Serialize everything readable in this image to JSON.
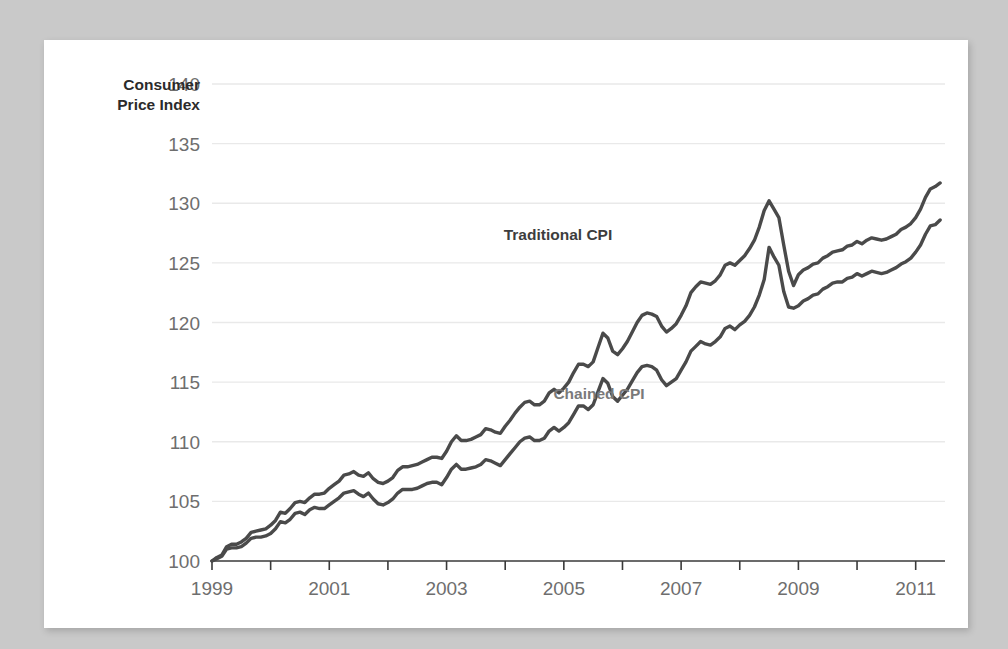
{
  "figure": {
    "background_color": "#c9c9c9",
    "card_color": "#ffffff"
  },
  "chart_data": {
    "type": "line",
    "title": "",
    "subtitle": "",
    "ylabel": "Consumer Price Index",
    "xlabel": "",
    "ylim": [
      100,
      140
    ],
    "xlim": [
      1999.0,
      2011.5
    ],
    "yticks": [
      100,
      105,
      110,
      115,
      120,
      125,
      130,
      135,
      140
    ],
    "ytick_labels": [
      "100",
      "105",
      "110",
      "115",
      "120",
      "125",
      "130",
      "135",
      "140"
    ],
    "xticks": [
      1999,
      2000,
      2001,
      2002,
      2003,
      2004,
      2005,
      2006,
      2007,
      2008,
      2009,
      2010,
      2011
    ],
    "xtick_labels": [
      "1999",
      "",
      "2001",
      "",
      "2003",
      "",
      "2005",
      "",
      "2007",
      "",
      "2009",
      "",
      "2011"
    ],
    "grid": "horizontal",
    "legend_position": "inline-annotations",
    "line_color": "#4a4a4a",
    "annotations": [
      {
        "text": "Traditional CPI",
        "x": 2004.9,
        "y": 126.9,
        "color": "#3d3d3d"
      },
      {
        "text": "Chained CPI",
        "x": 2005.6,
        "y": 113.6,
        "color": "#7a7a7a"
      }
    ],
    "series": [
      {
        "name": "Traditional CPI",
        "color": "#4a4a4a",
        "x": [
          1999.0,
          1999.083,
          1999.167,
          1999.25,
          1999.333,
          1999.417,
          1999.5,
          1999.583,
          1999.667,
          1999.75,
          1999.833,
          1999.917,
          2000.0,
          2000.083,
          2000.167,
          2000.25,
          2000.333,
          2000.417,
          2000.5,
          2000.583,
          2000.667,
          2000.75,
          2000.833,
          2000.917,
          2001.0,
          2001.083,
          2001.167,
          2001.25,
          2001.333,
          2001.417,
          2001.5,
          2001.583,
          2001.667,
          2001.75,
          2001.833,
          2001.917,
          2002.0,
          2002.083,
          2002.167,
          2002.25,
          2002.333,
          2002.417,
          2002.5,
          2002.583,
          2002.667,
          2002.75,
          2002.833,
          2002.917,
          2003.0,
          2003.083,
          2003.167,
          2003.25,
          2003.333,
          2003.417,
          2003.5,
          2003.583,
          2003.667,
          2003.75,
          2003.833,
          2003.917,
          2004.0,
          2004.083,
          2004.167,
          2004.25,
          2004.333,
          2004.417,
          2004.5,
          2004.583,
          2004.667,
          2004.75,
          2004.833,
          2004.917,
          2005.0,
          2005.083,
          2005.167,
          2005.25,
          2005.333,
          2005.417,
          2005.5,
          2005.583,
          2005.667,
          2005.75,
          2005.833,
          2005.917,
          2006.0,
          2006.083,
          2006.167,
          2006.25,
          2006.333,
          2006.417,
          2006.5,
          2006.583,
          2006.667,
          2006.75,
          2006.833,
          2006.917,
          2007.0,
          2007.083,
          2007.167,
          2007.25,
          2007.333,
          2007.417,
          2007.5,
          2007.583,
          2007.667,
          2007.75,
          2007.833,
          2007.917,
          2008.0,
          2008.083,
          2008.167,
          2008.25,
          2008.333,
          2008.417,
          2008.5,
          2008.583,
          2008.667,
          2008.75,
          2008.833,
          2008.917,
          2009.0,
          2009.083,
          2009.167,
          2009.25,
          2009.333,
          2009.417,
          2009.5,
          2009.583,
          2009.667,
          2009.75,
          2009.833,
          2009.917,
          2010.0,
          2010.083,
          2010.167,
          2010.25,
          2010.333,
          2010.417,
          2010.5,
          2010.583,
          2010.667,
          2010.75,
          2010.833,
          2010.917,
          2011.0,
          2011.083,
          2011.167,
          2011.25,
          2011.333,
          2011.417
        ],
        "y": [
          100.0,
          100.3,
          100.5,
          101.2,
          101.4,
          101.4,
          101.6,
          101.9,
          102.4,
          102.5,
          102.6,
          102.7,
          103.0,
          103.4,
          104.1,
          104.0,
          104.4,
          104.9,
          105.0,
          104.9,
          105.3,
          105.6,
          105.6,
          105.7,
          106.1,
          106.4,
          106.7,
          107.2,
          107.3,
          107.5,
          107.2,
          107.1,
          107.4,
          106.9,
          106.6,
          106.5,
          106.7,
          107.0,
          107.6,
          107.9,
          107.9,
          108.0,
          108.1,
          108.3,
          108.5,
          108.7,
          108.7,
          108.6,
          109.2,
          110.0,
          110.5,
          110.1,
          110.1,
          110.2,
          110.4,
          110.6,
          111.1,
          111.0,
          110.8,
          110.7,
          111.3,
          111.8,
          112.4,
          112.9,
          113.3,
          113.4,
          113.1,
          113.1,
          113.4,
          114.1,
          114.4,
          114.1,
          114.5,
          115.0,
          115.8,
          116.5,
          116.5,
          116.3,
          116.7,
          117.9,
          119.1,
          118.7,
          117.6,
          117.3,
          117.8,
          118.4,
          119.2,
          120.0,
          120.6,
          120.8,
          120.7,
          120.5,
          119.7,
          119.2,
          119.5,
          119.9,
          120.6,
          121.4,
          122.5,
          123.0,
          123.4,
          123.3,
          123.2,
          123.5,
          124.0,
          124.8,
          125.0,
          124.8,
          125.2,
          125.6,
          126.2,
          126.9,
          128.0,
          129.4,
          130.2,
          129.5,
          128.8,
          126.5,
          124.3,
          123.1,
          124.0,
          124.4,
          124.6,
          124.9,
          125.0,
          125.4,
          125.6,
          125.9,
          126.0,
          126.1,
          126.4,
          126.5,
          126.8,
          126.6,
          126.9,
          127.1,
          127.0,
          126.9,
          127.0,
          127.2,
          127.4,
          127.8,
          128.0,
          128.3,
          128.8,
          129.5,
          130.5,
          131.2,
          131.4,
          131.7
        ],
        "y_start": 100.0,
        "y_end": 131.7,
        "y_peak": 130.2,
        "y_peak_x": 2008.5
      },
      {
        "name": "Chained CPI",
        "color": "#4a4a4a",
        "x": [
          1999.0,
          1999.083,
          1999.167,
          1999.25,
          1999.333,
          1999.417,
          1999.5,
          1999.583,
          1999.667,
          1999.75,
          1999.833,
          1999.917,
          2000.0,
          2000.083,
          2000.167,
          2000.25,
          2000.333,
          2000.417,
          2000.5,
          2000.583,
          2000.667,
          2000.75,
          2000.833,
          2000.917,
          2001.0,
          2001.083,
          2001.167,
          2001.25,
          2001.333,
          2001.417,
          2001.5,
          2001.583,
          2001.667,
          2001.75,
          2001.833,
          2001.917,
          2002.0,
          2002.083,
          2002.167,
          2002.25,
          2002.333,
          2002.417,
          2002.5,
          2002.583,
          2002.667,
          2002.75,
          2002.833,
          2002.917,
          2003.0,
          2003.083,
          2003.167,
          2003.25,
          2003.333,
          2003.417,
          2003.5,
          2003.583,
          2003.667,
          2003.75,
          2003.833,
          2003.917,
          2004.0,
          2004.083,
          2004.167,
          2004.25,
          2004.333,
          2004.417,
          2004.5,
          2004.583,
          2004.667,
          2004.75,
          2004.833,
          2004.917,
          2005.0,
          2005.083,
          2005.167,
          2005.25,
          2005.333,
          2005.417,
          2005.5,
          2005.583,
          2005.667,
          2005.75,
          2005.833,
          2005.917,
          2006.0,
          2006.083,
          2006.167,
          2006.25,
          2006.333,
          2006.417,
          2006.5,
          2006.583,
          2006.667,
          2006.75,
          2006.833,
          2006.917,
          2007.0,
          2007.083,
          2007.167,
          2007.25,
          2007.333,
          2007.417,
          2007.5,
          2007.583,
          2007.667,
          2007.75,
          2007.833,
          2007.917,
          2008.0,
          2008.083,
          2008.167,
          2008.25,
          2008.333,
          2008.417,
          2008.5,
          2008.583,
          2008.667,
          2008.75,
          2008.833,
          2008.917,
          2009.0,
          2009.083,
          2009.167,
          2009.25,
          2009.333,
          2009.417,
          2009.5,
          2009.583,
          2009.667,
          2009.75,
          2009.833,
          2009.917,
          2010.0,
          2010.083,
          2010.167,
          2010.25,
          2010.333,
          2010.417,
          2010.5,
          2010.583,
          2010.667,
          2010.75,
          2010.833,
          2010.917,
          2011.0,
          2011.083,
          2011.167,
          2011.25,
          2011.333,
          2011.417
        ],
        "y": [
          100.0,
          100.2,
          100.4,
          101.0,
          101.1,
          101.1,
          101.2,
          101.5,
          101.9,
          102.0,
          102.0,
          102.1,
          102.3,
          102.7,
          103.3,
          103.2,
          103.5,
          104.0,
          104.1,
          103.9,
          104.3,
          104.5,
          104.4,
          104.4,
          104.7,
          105.0,
          105.3,
          105.7,
          105.8,
          105.9,
          105.6,
          105.4,
          105.7,
          105.2,
          104.8,
          104.7,
          104.9,
          105.2,
          105.7,
          106.0,
          106.0,
          106.0,
          106.1,
          106.3,
          106.5,
          106.6,
          106.6,
          106.4,
          107.0,
          107.7,
          108.1,
          107.7,
          107.7,
          107.8,
          107.9,
          108.1,
          108.5,
          108.4,
          108.2,
          108.0,
          108.5,
          109.0,
          109.5,
          110.0,
          110.3,
          110.4,
          110.1,
          110.1,
          110.3,
          110.9,
          111.2,
          110.9,
          111.2,
          111.6,
          112.3,
          113.0,
          113.0,
          112.7,
          113.1,
          114.2,
          115.3,
          114.9,
          113.8,
          113.4,
          113.9,
          114.4,
          115.1,
          115.8,
          116.3,
          116.4,
          116.3,
          116.0,
          115.2,
          114.7,
          115.0,
          115.3,
          116.0,
          116.7,
          117.6,
          118.0,
          118.4,
          118.2,
          118.1,
          118.4,
          118.8,
          119.5,
          119.7,
          119.4,
          119.8,
          120.1,
          120.6,
          121.3,
          122.3,
          123.6,
          126.3,
          125.5,
          124.8,
          122.6,
          121.3,
          121.2,
          121.4,
          121.8,
          122.0,
          122.3,
          122.4,
          122.8,
          123.0,
          123.3,
          123.4,
          123.4,
          123.7,
          123.8,
          124.1,
          123.9,
          124.1,
          124.3,
          124.2,
          124.1,
          124.2,
          124.4,
          124.6,
          124.9,
          125.1,
          125.4,
          125.9,
          126.5,
          127.4,
          128.1,
          128.2,
          128.6
        ],
        "y_start": 100.0,
        "y_end": 128.6,
        "y_peak": 126.3,
        "y_peak_x": 2008.5
      }
    ]
  }
}
